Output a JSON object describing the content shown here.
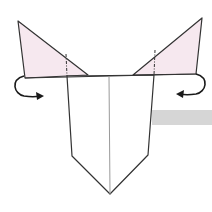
{
  "diagram": {
    "type": "origami-fold-step",
    "colors": {
      "background": "#ffffff",
      "paper_front": "#ffffff",
      "paper_back": "#f6e8ef",
      "outline": "#333333",
      "center_crease": "#9a9a9a",
      "arrow": "#1a1a1a",
      "side_bar": "#d6d6d6"
    },
    "elements": {
      "left_flap": "triangle-flap-left",
      "right_flap": "triangle-flap-right",
      "body": "pentagon-body",
      "center_crease": "vertical-crease",
      "left_arrow": "curved-arrow-fold-back-left",
      "right_arrow": "curved-arrow-fold-back-right",
      "left_fold_line": "dashed-valley-line-left",
      "right_fold_line": "dashed-valley-line-right",
      "side_bar": "gray-bar"
    }
  }
}
